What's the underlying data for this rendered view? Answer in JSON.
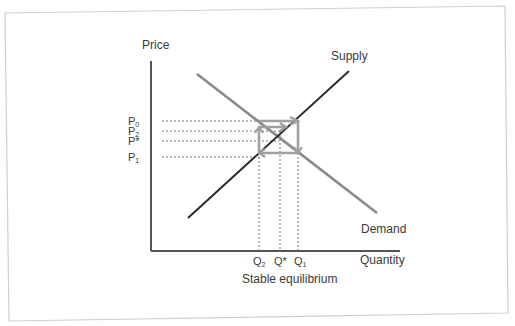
{
  "diagram": {
    "type": "cobweb-supply-demand",
    "caption": "Stable equilibrium",
    "axes": {
      "y_label": "Price",
      "x_label": "Quantity"
    },
    "curves": {
      "supply_label": "Supply",
      "demand_label": "Demand"
    },
    "price_levels": [
      {
        "id": "P0",
        "label": "P",
        "sub": "0"
      },
      {
        "id": "P2",
        "label": "P",
        "sub": "2"
      },
      {
        "id": "Pstar",
        "label": "P*",
        "sub": ""
      },
      {
        "id": "P1",
        "label": "P",
        "sub": "1"
      }
    ],
    "quantity_levels": [
      {
        "id": "Q2",
        "label": "Q",
        "sub": "2"
      },
      {
        "id": "Qstar",
        "label": "Q*",
        "sub": ""
      },
      {
        "id": "Q1",
        "label": "Q",
        "sub": "1"
      }
    ],
    "colors": {
      "axis": "#555555",
      "supply": "#2b2b2b",
      "demand": "#8a8a8a",
      "cobweb": "#a0a0a0",
      "guide": "#777777",
      "frame": "#cfcfcf",
      "text": "#3a3a3a"
    }
  }
}
